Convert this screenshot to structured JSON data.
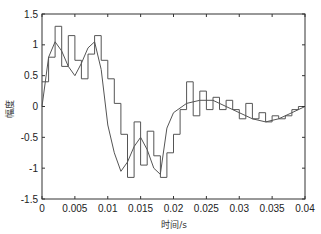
{
  "chart_data": {
    "type": "line",
    "title": "",
    "xlabel": "时间/s",
    "ylabel": "幅度",
    "xlim": [
      0,
      0.04
    ],
    "ylim": [
      -1.5,
      1.5
    ],
    "grid": false,
    "legend": null,
    "xticks": [
      "0",
      "0.005",
      "0.01",
      "0.015",
      "0.02",
      "0.025",
      "0.03",
      "0.035",
      "0.04"
    ],
    "yticks": [
      "1.5",
      "1",
      "0.5",
      "0",
      "-0.5",
      "-1",
      "-1.5"
    ],
    "series": [
      {
        "name": "staircase",
        "style": "step",
        "step_width": 0.001,
        "x_start": 0,
        "values": [
          0.4,
          0.8,
          1.3,
          0.65,
          1.15,
          0.75,
          0.45,
          0.85,
          1.15,
          0.75,
          0.45,
          0.05,
          -0.45,
          -1.15,
          -0.25,
          -0.95,
          -0.4,
          -0.8,
          -1.15,
          -0.75,
          -0.45,
          -0.05,
          0.4,
          -0.15,
          0.25,
          -0.05,
          0.15,
          -0.05,
          0.1,
          -0.05,
          -0.2,
          0.05,
          -0.2,
          -0.1,
          -0.25,
          -0.15,
          -0.2,
          -0.15,
          -0.05,
          0.0
        ]
      },
      {
        "name": "reference",
        "style": "line",
        "x": [
          0,
          0.001,
          0.002,
          0.003,
          0.004,
          0.005,
          0.006,
          0.007,
          0.008,
          0.009,
          0.01,
          0.011,
          0.012,
          0.013,
          0.014,
          0.015,
          0.016,
          0.017,
          0.018,
          0.019,
          0.02,
          0.022,
          0.024,
          0.026,
          0.028,
          0.03,
          0.032,
          0.034,
          0.036,
          0.038,
          0.04
        ],
        "y": [
          0.0,
          0.8,
          1.05,
          0.9,
          0.65,
          0.5,
          0.7,
          0.95,
          1.05,
          0.6,
          -0.3,
          -0.75,
          -1.05,
          -0.9,
          -0.65,
          -0.5,
          -0.7,
          -1.0,
          -1.1,
          -0.35,
          -0.1,
          0.05,
          0.1,
          0.1,
          0.0,
          -0.1,
          -0.2,
          -0.25,
          -0.2,
          -0.1,
          0.0
        ]
      }
    ],
    "line_color": "#555555",
    "axis_color": "#333333"
  }
}
